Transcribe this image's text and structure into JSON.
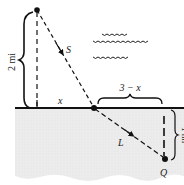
{
  "diagram": {
    "type": "geometry-word-problem",
    "colors": {
      "ink": "#111111",
      "land_fill": "#e9e9e9",
      "background": "#ffffff"
    },
    "labels": {
      "vertical_distance": "2 mi",
      "segment_water": "S",
      "horizontal_x": "x",
      "remaining": "3 − x",
      "segment_land": "L",
      "offset_distance": "1 mi",
      "destination": "Q"
    },
    "points": {
      "start": {
        "x": 37,
        "y": 10
      },
      "shore_foot": {
        "x": 37,
        "y": 108
      },
      "landing": {
        "x": 95,
        "y": 108
      },
      "destination": {
        "x": 165,
        "y": 159
      },
      "dest_shore": {
        "x": 165,
        "y": 108
      }
    },
    "water_waves": 3
  }
}
